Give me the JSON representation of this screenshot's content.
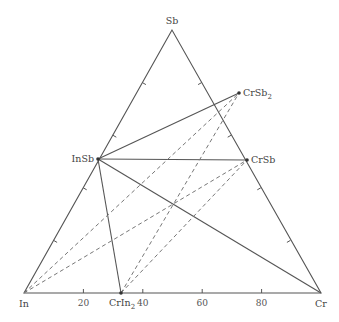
{
  "diagram": {
    "type": "ternary-phase-diagram",
    "vertices": {
      "top": {
        "label": "Sb",
        "x": 172,
        "y": 30
      },
      "left": {
        "label": "In",
        "x": 24,
        "y": 293
      },
      "right": {
        "label": "Cr",
        "x": 321,
        "y": 293
      }
    },
    "phases": [
      {
        "id": "CrSb2",
        "label": "CrSb",
        "sub": "2",
        "x": 239,
        "y": 93
      },
      {
        "id": "InSb",
        "label": "InSb",
        "sub": "",
        "x": 98,
        "y": 159
      },
      {
        "id": "CrSb",
        "label": "CrSb",
        "sub": "",
        "x": 247,
        "y": 160
      },
      {
        "id": "CrIn2",
        "label": "CrIn",
        "sub": "2",
        "x": 121,
        "y": 293
      }
    ],
    "solid_tie_lines": [
      [
        "InSb",
        "CrSb2"
      ],
      [
        "InSb",
        "CrSb"
      ],
      [
        "InSb",
        "CrIn2"
      ],
      [
        "InSb",
        "Cr"
      ]
    ],
    "dashed_tie_lines": [
      [
        "In",
        "CrSb2"
      ],
      [
        "In",
        "CrSb"
      ],
      [
        "CrIn2",
        "CrSb2"
      ],
      [
        "CrIn2",
        "CrSb"
      ]
    ],
    "base_axis_ticks": [
      "20",
      "40",
      "60",
      "80"
    ]
  }
}
